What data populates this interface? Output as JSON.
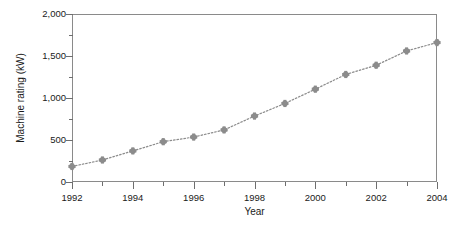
{
  "chart_data": {
    "type": "line",
    "title": "",
    "xlabel": "Year",
    "ylabel": "Machine rating (kW)",
    "x": [
      1992,
      1993,
      1994,
      1995,
      1996,
      1997,
      1998,
      1999,
      2000,
      2001,
      2002,
      2003,
      2004
    ],
    "values": [
      185,
      262,
      370,
      480,
      535,
      620,
      785,
      935,
      1105,
      1280,
      1390,
      1560,
      1660
    ],
    "series": [
      {
        "name": "Machine rating",
        "values": [
          185,
          262,
          370,
          480,
          535,
          620,
          785,
          935,
          1105,
          1280,
          1390,
          1560,
          1660
        ]
      }
    ],
    "xlim": [
      1992,
      2004
    ],
    "ylim": [
      0,
      2000
    ],
    "grid": false,
    "legend": "none",
    "line_style": "dotted",
    "marker": "star",
    "series_color": "#8c8c8c",
    "axis_color": "#8a8a8a",
    "x_ticks_major": [
      1992,
      1994,
      1996,
      1998,
      2000,
      2002,
      2004
    ],
    "x_tick_labels": [
      "1992",
      "1994",
      "1996",
      "1998",
      "2000",
      "2002",
      "2004"
    ],
    "x_ticks_minor": [
      1993,
      1995,
      1997,
      1999,
      2001,
      2003
    ],
    "y_ticks_major": [
      0,
      500,
      1000,
      1500,
      2000
    ],
    "y_tick_labels": [
      "0",
      "500",
      "1,000",
      "1,500",
      "2,000"
    ],
    "y_ticks_minor": [
      250,
      750,
      1250,
      1750
    ]
  }
}
